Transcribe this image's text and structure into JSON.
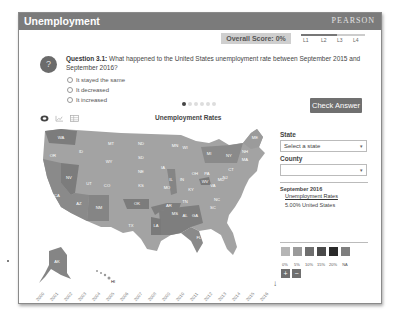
{
  "window": {
    "title": "Unemployment",
    "brand": "PEARSON"
  },
  "score": {
    "label": "Overall Score: 0%"
  },
  "levels": [
    "L1",
    "L2",
    "L3",
    "L4"
  ],
  "question": {
    "number_label": "Question 3.1:",
    "text": "What happened to the United States unemployment rate between September 2015 and September 2016?",
    "options": [
      "It stayed the same",
      "It decreased",
      "It increased"
    ],
    "icon": "question-mark-icon"
  },
  "pager": {
    "count": 6,
    "active": 0
  },
  "check_answer": {
    "label": "Check Answer"
  },
  "view_icons": [
    "map-view-icon",
    "line-chart-icon",
    "table-view-icon"
  ],
  "map": {
    "title": "Unemployment Rates",
    "states": [
      "WA",
      "OR",
      "CA",
      "ID",
      "NV",
      "MT",
      "WY",
      "UT",
      "AZ",
      "CO",
      "NM",
      "ND",
      "SD",
      "NE",
      "KS",
      "OK",
      "TX",
      "MN",
      "IA",
      "MO",
      "AR",
      "LA",
      "WI",
      "IL",
      "MI",
      "IN",
      "OH",
      "KY",
      "TN",
      "MS",
      "AL",
      "GA",
      "FL",
      "SC",
      "NC",
      "VA",
      "WV",
      "PA",
      "NY",
      "ME",
      "NH",
      "MA",
      "CT",
      "NJ",
      "MD",
      "DE",
      "AK",
      "HI"
    ]
  },
  "side": {
    "state_label": "State",
    "state_value": "Select a state",
    "county_label": "County",
    "county_value": "",
    "date": "September 2016",
    "link": "Unemployment Rates",
    "value": "5.00% United States"
  },
  "legend": {
    "labels": [
      "0%",
      "5%",
      "10%",
      "15%",
      "20%",
      "NA"
    ],
    "colors": [
      "#b5b5b5",
      "#9a9a9a",
      "#6e6e6e",
      "#4a4a4a",
      "#2a2a2a",
      "#7e7e7e"
    ]
  },
  "zoom_controls": {
    "plus": "+",
    "minus": "−"
  },
  "timeline": {
    "years": [
      "2000",
      "2001",
      "2002",
      "2003",
      "2004",
      "2005",
      "2006",
      "2007",
      "2008",
      "2009",
      "2010",
      "2011",
      "2012",
      "2013",
      "2014",
      "2015",
      "2016"
    ]
  }
}
